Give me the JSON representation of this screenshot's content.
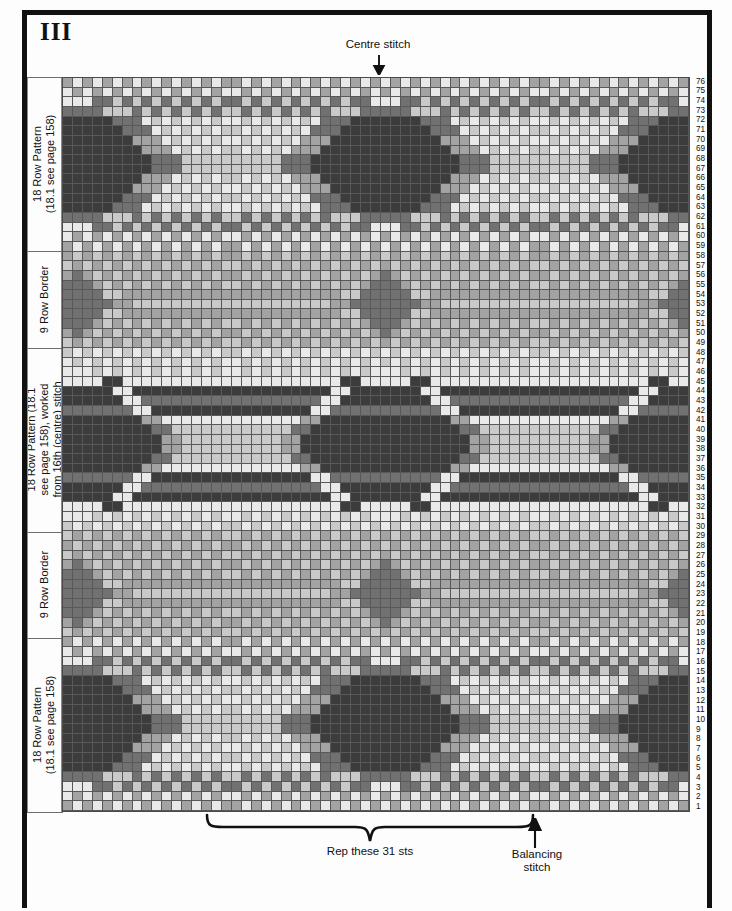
{
  "plate": {
    "numeral": "III"
  },
  "annotations": {
    "centre_stitch": "Centre stitch",
    "centre_arrow_icon": "down-arrow-icon",
    "repeat": "Rep these 31 sts",
    "repeat_brace_icon": "curly-brace-icon",
    "balancing": "Balancing\nstitch",
    "balancing_line1": "Balancing",
    "balancing_line2": "stitch",
    "balancing_arrow_icon": "up-arrow-icon"
  },
  "sections": [
    {
      "id": "top-pattern",
      "label": "18 Row Pattern\n(18.1 see page 158)",
      "rows": [
        59,
        76
      ]
    },
    {
      "id": "top-border",
      "label": "9 Row Border",
      "rows": [
        49,
        58
      ]
    },
    {
      "id": "centre-pattern",
      "label": "18 Row Pattern (18.1\nsee page 158), worked\nfrom 16th (centre) stitch",
      "rows": [
        30,
        48
      ]
    },
    {
      "id": "bottom-border",
      "label": "9 Row Border",
      "rows": [
        19,
        29
      ]
    },
    {
      "id": "bottom-pattern",
      "label": "18 Row Pattern\n(18.1 see page 158)",
      "rows": [
        1,
        18
      ]
    }
  ],
  "chart_data": {
    "type": "heatmap",
    "xlabel": "stitches",
    "ylabel": "rows",
    "grid": true,
    "columns": 63,
    "rows": 76,
    "row_numbers_top_to_bottom": [
      76,
      75,
      74,
      73,
      72,
      71,
      70,
      69,
      68,
      67,
      66,
      65,
      64,
      63,
      62,
      61,
      60,
      59,
      58,
      57,
      56,
      55,
      54,
      53,
      52,
      51,
      50,
      49,
      48,
      47,
      46,
      45,
      44,
      43,
      42,
      41,
      40,
      39,
      38,
      37,
      36,
      35,
      34,
      33,
      32,
      31,
      30,
      29,
      28,
      27,
      26,
      25,
      24,
      23,
      22,
      21,
      20,
      19,
      18,
      17,
      16,
      15,
      14,
      13,
      12,
      11,
      10,
      9,
      8,
      7,
      6,
      5,
      4,
      3,
      2,
      1
    ],
    "repeat_stitches": 31,
    "repeat_start_column": 15,
    "balancing_stitch_column": 47,
    "centre_stitch_column": 32,
    "palette": {
      "0": "#e9e9e9",
      "1": "#c9c9c9",
      "2": "#a3a3a3",
      "3": "#717171",
      "4": "#3c3c3c"
    },
    "palette_names": [
      "white",
      "light-grey",
      "mid-grey",
      "dark-grey",
      "darkest"
    ],
    "motif_note": "OXO Fair Isle: 18-row peerie/large pattern bands separated by 9-row borders"
  }
}
